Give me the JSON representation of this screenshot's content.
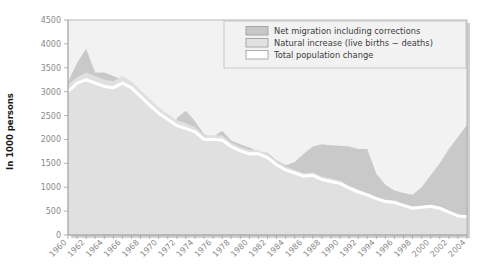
{
  "chart_data": {
    "type": "area",
    "title": "",
    "xlabel": "",
    "ylabel": "In 1000 persons",
    "ylim": [
      0,
      4500
    ],
    "ytick_step": 500,
    "yticks": [
      "0",
      "500",
      "1000",
      "1500",
      "2000",
      "2500",
      "3000",
      "3500",
      "4000",
      "4500"
    ],
    "xlim": [
      1960,
      2004
    ],
    "xticks_all_years": true,
    "xtick_labels": [
      "1960",
      "1962",
      "1964",
      "1966",
      "1968",
      "1970",
      "1972",
      "1974",
      "1976",
      "1978",
      "1980",
      "1982",
      "1984",
      "1986",
      "1988",
      "1990",
      "1992",
      "1994",
      "1996",
      "1998",
      "2000",
      "2002",
      "2004"
    ],
    "grid": false,
    "legend_position": "top-right",
    "legend": [
      {
        "label": "Net migration including corrections",
        "color": "#c8c8c8",
        "border": "#9a9a9a"
      },
      {
        "label": "Natural increase (live births − deaths)",
        "color": "#e2e2e2",
        "border": "#9a9a9a"
      },
      {
        "label": "Total population change",
        "color": "#ffffff",
        "border": "#9a9a9a"
      }
    ],
    "x": [
      1960,
      1961,
      1962,
      1963,
      1964,
      1965,
      1966,
      1967,
      1968,
      1969,
      1970,
      1971,
      1972,
      1973,
      1974,
      1975,
      1976,
      1977,
      1978,
      1979,
      1980,
      1981,
      1982,
      1983,
      1984,
      1985,
      1986,
      1987,
      1988,
      1989,
      1990,
      1991,
      1992,
      1993,
      1994,
      1995,
      1996,
      1997,
      1998,
      1999,
      2000,
      2001,
      2002,
      2003,
      2004
    ],
    "series": [
      {
        "name": "Total population change",
        "values": [
          3000,
          3180,
          3250,
          3180,
          3110,
          3080,
          3180,
          3080,
          2900,
          2720,
          2550,
          2420,
          2290,
          2230,
          2160,
          2000,
          2000,
          1990,
          1850,
          1760,
          1700,
          1700,
          1620,
          1470,
          1360,
          1300,
          1230,
          1250,
          1160,
          1120,
          1080,
          980,
          900,
          840,
          760,
          700,
          680,
          620,
          560,
          580,
          600,
          560,
          480,
          400,
          380
        ]
      },
      {
        "name": "Natural increase (live births − deaths)",
        "values": [
          3150,
          3300,
          3400,
          3330,
          3250,
          3220,
          3330,
          3220,
          3030,
          2850,
          2670,
          2530,
          2400,
          2340,
          2260,
          2090,
          2090,
          2080,
          1930,
          1840,
          1780,
          1780,
          1700,
          1540,
          1430,
          1360,
          1290,
          1310,
          1220,
          1180,
          1130,
          1030,
          950,
          880,
          800,
          740,
          720,
          650,
          590,
          610,
          630,
          590,
          510,
          430,
          400
        ]
      },
      {
        "name": "Net migration including corrections",
        "values": [
          3200,
          3600,
          3900,
          3400,
          3400,
          3330,
          3250,
          2980,
          2690,
          2580,
          2670,
          1450,
          2450,
          2600,
          2380,
          2110,
          2050,
          2180,
          1980,
          1900,
          1830,
          1750,
          1720,
          1560,
          1460,
          1530,
          1700,
          1850,
          1900,
          1880,
          1870,
          1850,
          1800,
          1800,
          1280,
          1050,
          930,
          880,
          840,
          1000,
          1250,
          1500,
          1800,
          2050,
          2300
        ]
      }
    ]
  },
  "plot": {
    "left": 68,
    "right": 467,
    "top": 20,
    "bottom": 235,
    "bg_color": "#f2f2f2",
    "band_outer_color": "#c9c9c9",
    "band_inner_color": "#e0e0e0",
    "line_color": "#ffffff",
    "axis_color": "#a8a8a8"
  }
}
